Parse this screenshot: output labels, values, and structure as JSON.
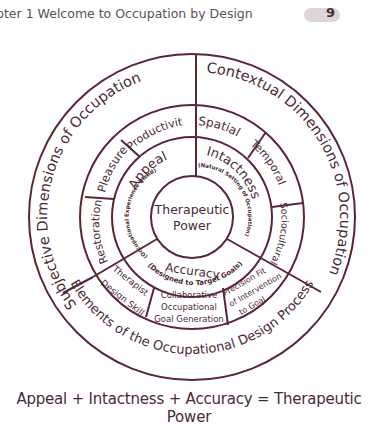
{
  "header": {
    "chapter_text": "pter 1   Welcome to Occupation by Design",
    "page_number": "9"
  },
  "diagram": {
    "line_color": "#5a2630",
    "text_color": "#4a2a33",
    "center": {
      "line1": "Therapeutic",
      "line2": "Power"
    },
    "inner_ring": {
      "appeal": "Appeal",
      "appeal_sub": "(Occupational Experience Blend)",
      "intactness": "Intactness",
      "intactness_sub": "(Natural Setting of Occupation)",
      "accuracy": "Accuracy",
      "accuracy_sub": "(Designed to Target Goals)"
    },
    "middle_ring": {
      "productivity": "Productivity",
      "pleasure": "Pleasure",
      "restoration": "Restoration",
      "spatial": "Spatial",
      "temporal": "Temporal",
      "sociocultural": "Sociocultural",
      "therapist_design_skill_1": "Therapist",
      "therapist_design_skill_2": "Design Skill",
      "collaborative_1": "Collaborative",
      "collaborative_2": "Occupational",
      "collaborative_3": "Goal Generation",
      "precision_1": "Precision Fit",
      "precision_2": "of Intervention",
      "precision_3": "to Goal"
    },
    "outer_ring": {
      "subjective": "Subjective Dimensions of Occupation",
      "contextual": "Contextual Dimensions of Occupation",
      "elements": "Elements of the Occupational Design Process"
    }
  },
  "formula": "Appeal + Intactness + Accuracy = Therapeutic  Power"
}
